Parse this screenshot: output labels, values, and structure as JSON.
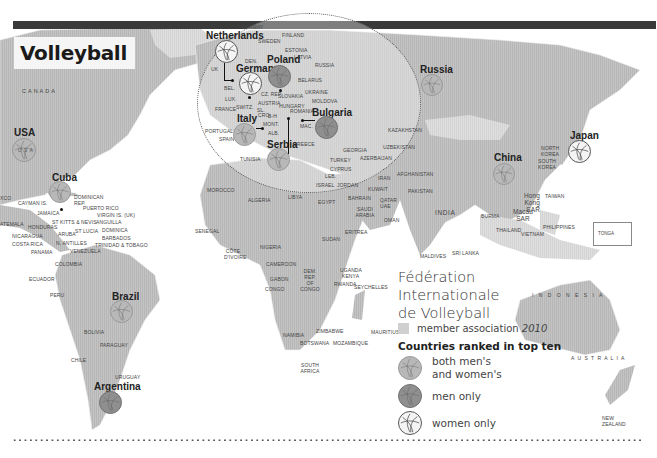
{
  "title": "Volleyball",
  "colors": {
    "land_member": "#bdbdbd",
    "land_nonmember": "#e2e2e2",
    "ocean": "#ffffff",
    "ball_both": "#b8b8b8",
    "ball_men": "#8f8f8f",
    "ball_women": "#f4f4f4",
    "bar": "#3a3a3a"
  },
  "legend": {
    "title_line1": "Fédération",
    "title_line2": "Internationale",
    "title_line3": "de Volleyball",
    "member_label": "member association",
    "member_year": "2010",
    "ranked_heading": "Countries ranked in top ten",
    "items": [
      {
        "type": "both",
        "icon": "volleyball-icon",
        "line1": "both men's",
        "line2": "and women's"
      },
      {
        "type": "men",
        "icon": "volleyball-icon",
        "line1": "men only"
      },
      {
        "type": "women",
        "icon": "volleyball-icon",
        "line1": "women only"
      }
    ]
  },
  "ranked_countries": [
    {
      "name": "USA",
      "category": "both"
    },
    {
      "name": "Cuba",
      "category": "both"
    },
    {
      "name": "Brazil",
      "category": "both"
    },
    {
      "name": "Argentina",
      "category": "men"
    },
    {
      "name": "Netherlands",
      "category": "women"
    },
    {
      "name": "Germany",
      "category": "women"
    },
    {
      "name": "Poland",
      "category": "men"
    },
    {
      "name": "Italy",
      "category": "both"
    },
    {
      "name": "Serbia",
      "category": "both"
    },
    {
      "name": "Bulgaria",
      "category": "men"
    },
    {
      "name": "Russia",
      "category": "both"
    },
    {
      "name": "China",
      "category": "both"
    },
    {
      "name": "Japan",
      "category": "women"
    }
  ],
  "map_labels": {
    "canada": "CANADA",
    "usa_inner": "U S A",
    "mexico_partial": "XCO",
    "guatemala_partial": "ATEMALA",
    "cayman": "CAYMAN IS.",
    "jamaica": "JAMAICA",
    "dominican": "DOMINICAN REP.",
    "puerto_rico": "PUERTO RICO",
    "virgin": "VIRGIN IS. (UK)",
    "anguilla": "ANGUILLA",
    "stkitts": "ST KITTS & NEVIS",
    "honduras": "HONDURAS",
    "nicaragua": "NICARAGUA",
    "aruba": "ARUBA",
    "stlucia": "ST LUCIA",
    "dominica": "DOMINICA",
    "barbados": "BARBADOS",
    "costa_rica": "COSTA RICA",
    "antilles": "N. ANTILLES",
    "trinidad": "TRINIDAD & TOBAGO",
    "panama": "PANAMA",
    "venezuela": "VENEZUELA",
    "colombia": "COLOMBIA",
    "ecuador": "ECUADOR",
    "peru": "PERU",
    "bolivia": "BOLIVIA",
    "paraguay": "PARAGUAY",
    "chile": "CHILE",
    "uruguay": "URUGUAY",
    "norway": "NORWAY",
    "finland": "FINLAND",
    "sweden": "SWEDEN",
    "estonia": "ESTONIA",
    "latvia": "LATVIA",
    "den": "DEN.",
    "uk": "UK",
    "russia_inset": "RUSSIA",
    "belarus": "BELARUS",
    "bel": "BEL.",
    "lux": "LUX.",
    "czrep": "CZ. REP.",
    "slovakia": "SLOVAKIA",
    "ukraine": "UKRAINE",
    "moldova": "MOLDOVA",
    "france": "FRANCE",
    "switz": "SWITZ.",
    "austria": "AUSTRIA",
    "hungary": "HUNGARY",
    "romania": "ROMANIA",
    "slo": "SL.",
    "cro": "CRO.",
    "bh": "B-H",
    "mont": "MONT.",
    "mac": "MAC.",
    "alb": "ALB.",
    "portugal": "PORTUGAL",
    "spain": "SPAIN",
    "greece": "GREECE",
    "tunisia": "TUNISIA",
    "morocco": "MOROCCO",
    "algeria": "ALGERIA",
    "libya": "LIBYA",
    "egypt": "EGYPT",
    "georgia": "GEORGIA",
    "turkey": "TURKEY",
    "azerbaijan": "AZERBAIJAN",
    "cyprus": "CYPRUS",
    "leb": "LEB.",
    "israel": "ISRAEL",
    "jordan": "JORDAN",
    "kuwait": "KUWAIT",
    "bahrain": "BAHRAIN",
    "qatar": "QATAR",
    "uae": "UAE",
    "saudi": "SAUDI ARABIA",
    "oman": "OMAN",
    "iran": "IRAN",
    "afghanistan": "AFGHANISTAN",
    "pakistan": "PAKISTAN",
    "india": "INDIA",
    "kazakhstan": "KAZAKHSTAN",
    "uzbekistan": "UZBEKISTAN",
    "maldives": "MALDIVES",
    "srilanka": "SRI LANKA",
    "senegal": "SENEGAL",
    "cote": "CÔTE D'IVOIRE",
    "ghana": "GHANA",
    "nigeria": "NIGERIA",
    "cameroon": "CAMEROON",
    "gabon": "GABON",
    "congo": "CONGO",
    "drc": "DEM. REP. OF CONGO",
    "sudan": "SUDAN",
    "eritrea": "ERITREA",
    "uganda": "UGANDA",
    "kenya": "KENYA",
    "rwanda": "RWANDA",
    "seychelles": "SEYCHELLES",
    "namibia": "NAMIBIA",
    "zimbabwe": "ZIMBABWE",
    "botswana": "BOTSWANA",
    "mozambique": "MOZAMBIQUE",
    "south_africa": "SOUTH AFRICA",
    "mauritius": "MAURITIUS",
    "north_korea": "NORTH KOREA",
    "south_korea": "SOUTH KOREA",
    "hongkong": "Hong Kong SAR",
    "macau": "Macau SAR",
    "taiwan": "TAIWAN",
    "burma": "BURMA",
    "thailand": "THAILAND",
    "vietnam": "VIETNAM",
    "philippines": "PHILIPPINES",
    "indonesia": "I N D O N E S I A",
    "australia": "A U S T R A L I A",
    "new_zealand": "NEW ZEALAND",
    "tonga": "TONGA"
  }
}
